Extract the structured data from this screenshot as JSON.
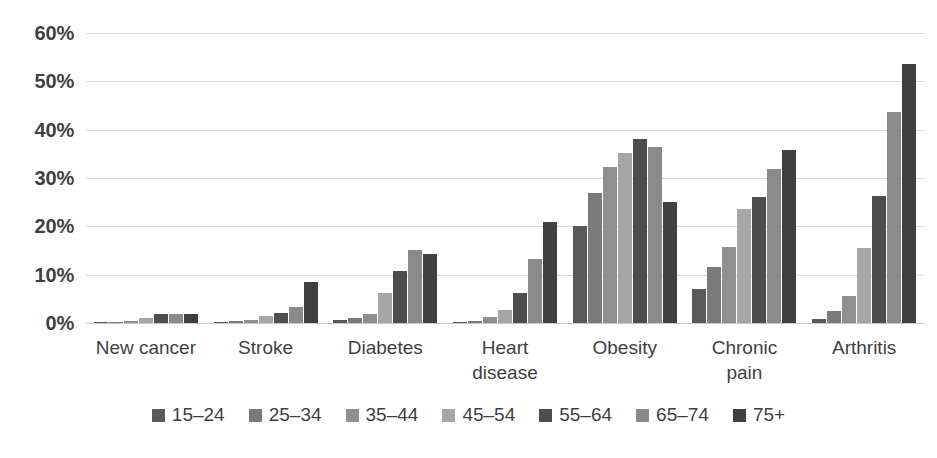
{
  "chart_data": {
    "type": "bar",
    "title": "",
    "subtitle": "",
    "xlabel": "",
    "ylabel": "",
    "ylim": [
      0,
      60
    ],
    "y_tick_labels": [
      "0%",
      "10%",
      "20%",
      "30%",
      "40%",
      "50%",
      "60%"
    ],
    "y_tick_values": [
      0,
      10,
      20,
      30,
      40,
      50,
      60
    ],
    "grid": true,
    "grid_axis": "y",
    "legend_position": "bottom",
    "categories": [
      "New cancer",
      "Stroke",
      "Diabetes",
      "Heart\ndisease",
      "Obesity",
      "Chronic\npain",
      "Arthritis"
    ],
    "series": [
      {
        "name": "15–24",
        "color": "#595959",
        "values": [
          0.2,
          0.2,
          0.7,
          0.3,
          20.0,
          7.0,
          0.8
        ]
      },
      {
        "name": "25–34",
        "color": "#7a7a7a",
        "values": [
          0.3,
          0.4,
          1.0,
          0.5,
          26.8,
          11.5,
          2.5
        ]
      },
      {
        "name": "35–44",
        "color": "#8f8f8f",
        "values": [
          0.5,
          0.7,
          1.8,
          1.2,
          32.2,
          15.7,
          5.5
        ]
      },
      {
        "name": "45–54",
        "color": "#a6a6a6",
        "values": [
          1.0,
          1.5,
          6.2,
          2.6,
          35.2,
          23.5,
          15.5
        ]
      },
      {
        "name": "55–64",
        "color": "#4d4d4d",
        "values": [
          1.8,
          2.0,
          10.8,
          6.2,
          38.0,
          26.0,
          26.3
        ]
      },
      {
        "name": "65–74",
        "color": "#8a8a8a",
        "values": [
          1.8,
          3.3,
          15.2,
          13.2,
          36.5,
          31.8,
          43.7
        ]
      },
      {
        "name": "75+",
        "color": "#404040",
        "values": [
          1.8,
          8.5,
          14.3,
          20.8,
          25.0,
          35.8,
          53.5
        ]
      }
    ]
  }
}
